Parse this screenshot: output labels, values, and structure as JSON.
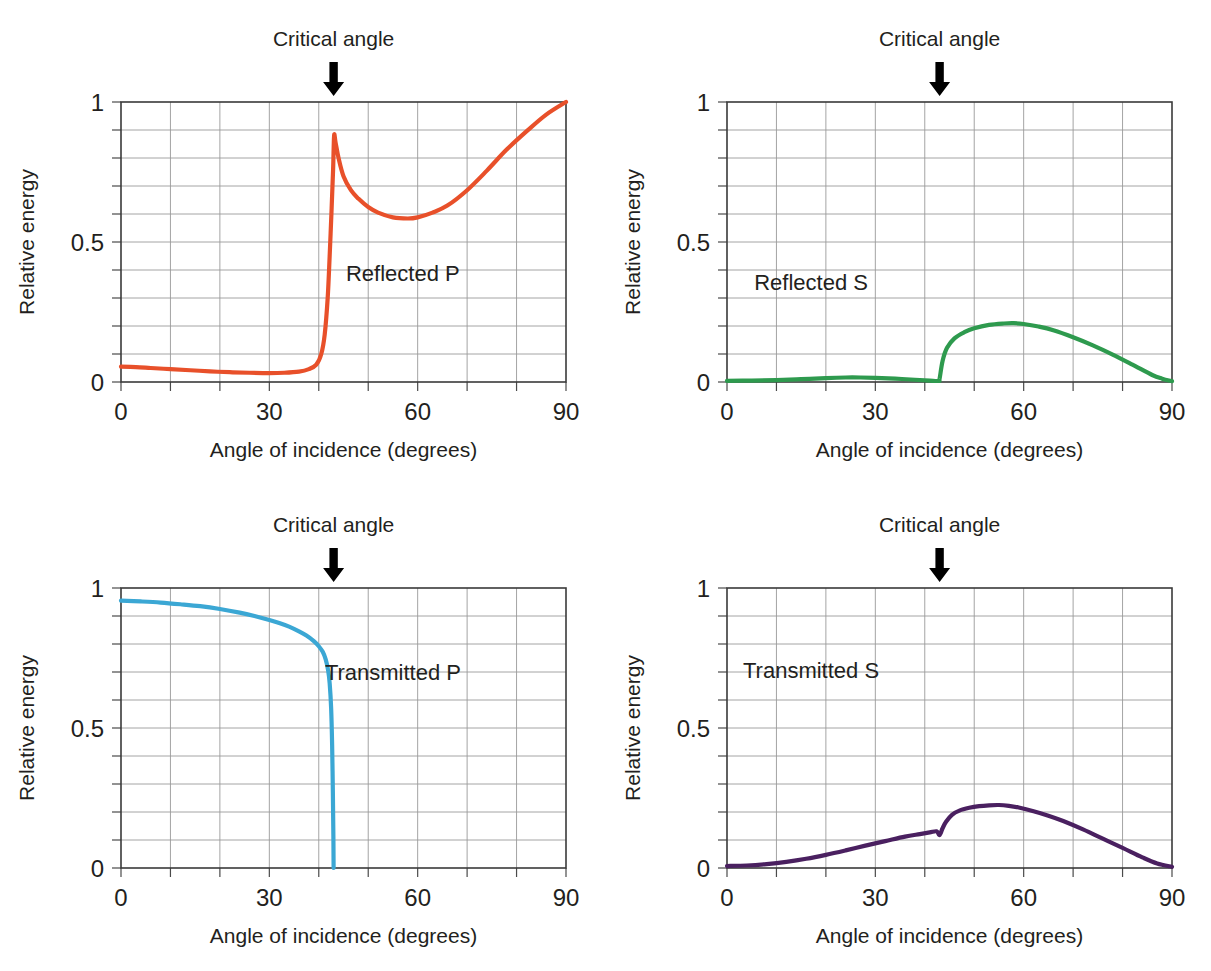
{
  "figure": {
    "common": {
      "xlabel": "Angle of incidence (degrees)",
      "ylabel": "Relative energy",
      "annotation": "Critical angle",
      "xticks": [
        "0",
        "30",
        "60",
        "90"
      ],
      "xtick_values": [
        0,
        30,
        60,
        90
      ],
      "yticks": [
        "0",
        "0.5",
        "1"
      ],
      "ytick_values": [
        0,
        0.5,
        1
      ],
      "xlim": [
        0,
        90
      ],
      "ylim": [
        0,
        1
      ],
      "grid_x_step": 10,
      "grid_y_step": 0.1,
      "critical_angle": 43,
      "grid": "on"
    },
    "colors": {
      "reflected_p": "#E8502A",
      "reflected_s": "#2E9A4E",
      "transmitted_p": "#3BA7D4",
      "transmitted_s": "#4A2060",
      "frame": "#3a3a3a",
      "grid": "#9a9a9a",
      "text": "#231f20",
      "arrow": "#000000"
    }
  },
  "chart_data": [
    {
      "id": "reflected-p",
      "type": "line",
      "title": "Reflected P",
      "xlabel": "Angle of incidence (degrees)",
      "ylabel": "Relative energy",
      "xlim": [
        0,
        90
      ],
      "ylim": [
        0,
        1
      ],
      "color": "#E8502A",
      "annotation": "Critical angle",
      "critical_angle": 43,
      "label_pos": {
        "x": 57,
        "y": 0.36
      },
      "x": [
        0,
        3,
        6,
        10,
        14,
        18,
        22,
        26,
        30,
        33,
        36,
        38,
        39.5,
        40.5,
        41.2,
        41.8,
        42.2,
        42.6,
        42.9,
        43.1,
        43.4,
        44,
        45,
        46.5,
        48,
        50,
        52,
        55,
        58,
        60,
        63,
        66,
        70,
        74,
        78,
        82,
        86,
        90
      ],
      "y": [
        0.055,
        0.053,
        0.05,
        0.046,
        0.042,
        0.038,
        0.035,
        0.033,
        0.032,
        0.033,
        0.037,
        0.046,
        0.062,
        0.1,
        0.17,
        0.3,
        0.45,
        0.62,
        0.76,
        0.88,
        0.855,
        0.8,
        0.735,
        0.685,
        0.655,
        0.625,
        0.605,
        0.588,
        0.584,
        0.588,
        0.605,
        0.63,
        0.685,
        0.755,
        0.83,
        0.895,
        0.955,
        1.0
      ]
    },
    {
      "id": "reflected-s",
      "type": "line",
      "title": "Reflected S",
      "xlabel": "Angle of incidence (degrees)",
      "ylabel": "Relative energy",
      "xlim": [
        0,
        90
      ],
      "ylim": [
        0,
        1
      ],
      "color": "#2E9A4E",
      "annotation": "Critical angle",
      "critical_angle": 43,
      "label_pos": {
        "x": 17,
        "y": 0.33
      },
      "x": [
        0,
        5,
        10,
        15,
        20,
        24,
        27,
        30,
        34,
        38,
        41,
        42.8,
        43.0,
        43.6,
        44.5,
        46,
        48,
        50,
        53,
        56,
        58,
        60,
        63,
        66,
        70,
        74,
        78,
        82,
        86,
        88,
        90
      ],
      "y": [
        0.004,
        0.005,
        0.007,
        0.01,
        0.014,
        0.016,
        0.016,
        0.015,
        0.012,
        0.008,
        0.005,
        0.004,
        0.012,
        0.075,
        0.122,
        0.156,
        0.178,
        0.192,
        0.204,
        0.209,
        0.21,
        0.207,
        0.198,
        0.185,
        0.16,
        0.131,
        0.098,
        0.062,
        0.025,
        0.012,
        0.003
      ]
    },
    {
      "id": "transmitted-p",
      "type": "line",
      "title": "Transmitted P",
      "xlabel": "Angle of incidence (degrees)",
      "ylabel": "Relative energy",
      "xlim": [
        0,
        90
      ],
      "ylim": [
        0,
        1
      ],
      "color": "#3BA7D4",
      "annotation": "Critical angle",
      "critical_angle": 43,
      "label_pos": {
        "x": 55,
        "y": 0.67
      },
      "x": [
        0,
        4,
        8,
        12,
        16,
        20,
        24,
        27,
        30,
        32,
        34,
        36,
        37.5,
        39,
        40,
        40.8,
        41.4,
        41.9,
        42.2,
        42.5,
        42.7,
        42.85,
        42.95,
        43.0
      ],
      "y": [
        0.955,
        0.952,
        0.948,
        0.942,
        0.935,
        0.925,
        0.912,
        0.9,
        0.886,
        0.875,
        0.862,
        0.845,
        0.83,
        0.81,
        0.792,
        0.772,
        0.745,
        0.705,
        0.66,
        0.57,
        0.44,
        0.27,
        0.12,
        0.0
      ]
    },
    {
      "id": "transmitted-s",
      "type": "line",
      "title": "Transmitted S",
      "xlabel": "Angle of incidence (degrees)",
      "ylabel": "Relative energy",
      "xlim": [
        0,
        90
      ],
      "ylim": [
        0,
        1
      ],
      "color": "#4A2060",
      "annotation": "Critical angle",
      "critical_angle": 43,
      "label_pos": {
        "x": 17,
        "y": 0.68
      },
      "x": [
        0,
        4,
        8,
        12,
        16,
        20,
        24,
        28,
        32,
        36,
        39,
        41,
        42.4,
        42.9,
        43.2,
        43.6,
        44.3,
        45.5,
        47,
        49,
        51,
        53,
        55,
        57,
        59,
        62,
        65,
        68,
        72,
        76,
        80,
        84,
        87,
        90
      ],
      "y": [
        0.007,
        0.009,
        0.014,
        0.022,
        0.033,
        0.047,
        0.063,
        0.08,
        0.096,
        0.112,
        0.121,
        0.127,
        0.131,
        0.118,
        0.124,
        0.142,
        0.165,
        0.19,
        0.205,
        0.215,
        0.221,
        0.224,
        0.225,
        0.222,
        0.216,
        0.203,
        0.187,
        0.168,
        0.138,
        0.105,
        0.072,
        0.038,
        0.016,
        0.004
      ]
    }
  ]
}
